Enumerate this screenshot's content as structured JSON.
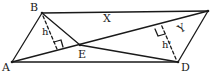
{
  "diagram": {
    "type": "geometry",
    "stroke_color": "#1a1a1a",
    "background": "#ffffff",
    "points": {
      "A": {
        "label": "A",
        "x": 12,
        "y": 62
      },
      "B": {
        "label": "B",
        "x": 42,
        "y": 13
      },
      "C": {
        "label": "",
        "x": 208,
        "y": 11
      },
      "D": {
        "label": "D",
        "x": 178,
        "y": 62
      },
      "E": {
        "label": "E",
        "x": 80,
        "y": 45
      }
    },
    "labels": {
      "A": "A",
      "B": "B",
      "D": "D",
      "E": "E",
      "region_x": "X",
      "region_y": "Y",
      "height_b": "h",
      "height_d": "h'"
    },
    "segments": [
      [
        "A",
        "B"
      ],
      [
        "B",
        "C"
      ],
      [
        "C",
        "D"
      ],
      [
        "A",
        "D"
      ],
      [
        "A",
        "C"
      ],
      [
        "B",
        "E"
      ],
      [
        "E",
        "D"
      ]
    ],
    "dashed_heights": [
      {
        "from": "B",
        "to_line": "AC",
        "label": "h"
      },
      {
        "from": "D",
        "to_line": "AC",
        "label": "h'"
      }
    ]
  }
}
